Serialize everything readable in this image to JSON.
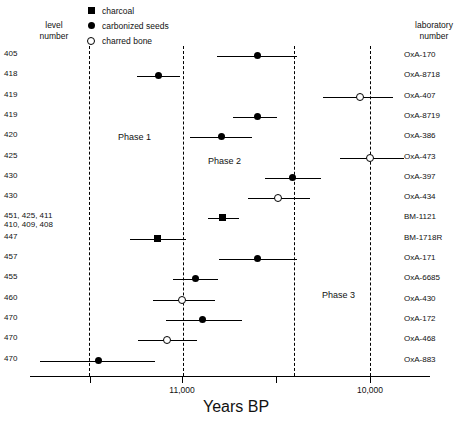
{
  "legend": {
    "items": [
      {
        "symbol": "filled-square",
        "label": "charcoal"
      },
      {
        "symbol": "filled-circle",
        "label": "carbonized seeds"
      },
      {
        "symbol": "open-circle",
        "label": "charred bone"
      }
    ]
  },
  "headers": {
    "level": "level\nnumber",
    "level_line1": "level",
    "level_line2": "number",
    "lab_line1": "laboratory",
    "lab_line2": "number"
  },
  "axis": {
    "title": "Years BP",
    "ticks": [
      {
        "label": "",
        "x": 90
      },
      {
        "label": "11,000",
        "x": 182
      },
      {
        "label": "",
        "x": 276
      },
      {
        "label": "10,000",
        "x": 370
      }
    ],
    "pixel_per_500_years": 93
  },
  "phases": [
    {
      "label": "Phase 1",
      "label_x": 118,
      "label_y": 132,
      "line_x": 89
    },
    {
      "label": "Phase 2",
      "label_x": 208,
      "label_y": 156,
      "line_x": 183
    },
    {
      "label": "Phase 3",
      "label_x": 322,
      "label_y": 290,
      "line_x": 294
    },
    {
      "label": "",
      "label_x": 0,
      "label_y": 0,
      "line_x": 370
    }
  ],
  "chart_data": {
    "type": "scatter",
    "title": "",
    "xlabel": "Years BP",
    "ylabel": "level number",
    "xlim": [
      11250,
      10000
    ],
    "x_axis_reversed": true,
    "grid": false,
    "legend_position": "top-center",
    "series": [
      {
        "name": "charcoal",
        "marker": "filled-square"
      },
      {
        "name": "carbonized seeds",
        "marker": "filled-circle"
      },
      {
        "name": "charred bone",
        "marker": "open-circle"
      }
    ],
    "annotations": [
      "Phase 1",
      "Phase 2",
      "Phase 3"
    ],
    "points": [
      {
        "level": "405",
        "lab": "OxA-170",
        "marker": "filled-circle",
        "value": 10900,
        "low": 11115,
        "high": 10685,
        "px_center": 257,
        "px_left": 217,
        "px_right": 297
      },
      {
        "level": "418",
        "lab": "OxA-8718",
        "marker": "filled-circle",
        "value": 11030,
        "low": 11145,
        "high": 10915,
        "px_center": 158,
        "px_left": 137,
        "px_right": 180
      },
      {
        "level": "419",
        "lab": "OxA-407",
        "marker": "open-circle",
        "value": 10345,
        "low": 10545,
        "high": 10165,
        "px_center": 360,
        "px_left": 323,
        "px_right": 393
      },
      {
        "level": "419",
        "lab": "OxA-8719",
        "marker": "filled-circle",
        "value": 10900,
        "low": 11030,
        "high": 10785,
        "px_center": 257,
        "px_left": 233,
        "px_right": 277
      },
      {
        "level": "420",
        "lab": "OxA-386",
        "marker": "filled-circle",
        "value": 11095,
        "low": 11260,
        "high": 10930,
        "px_center": 221,
        "px_left": 190,
        "px_right": 252
      },
      {
        "level": "425",
        "lab": "OxA-473",
        "marker": "open-circle",
        "value": 10290,
        "low": 10455,
        "high": 10110,
        "px_center": 370,
        "px_left": 340,
        "px_right": 404
      },
      {
        "level": "430",
        "lab": "OxA-397",
        "marker": "filled-circle",
        "value": 10710,
        "low": 10855,
        "high": 10560,
        "px_center": 292,
        "px_left": 265,
        "px_right": 321
      },
      {
        "level": "430",
        "lab": "OxA-434",
        "marker": "open-circle",
        "value": 10785,
        "low": 10945,
        "high": 10625,
        "px_center": 278,
        "px_left": 248,
        "px_right": 310
      },
      {
        "level": "451, 425, 411\n410, 409, 408",
        "lab": "BM-1121",
        "marker": "filled-square",
        "value": 11085,
        "low": 11160,
        "high": 11000,
        "px_center": 222,
        "px_left": 208,
        "px_right": 239
      },
      {
        "level": "447",
        "lab": "BM-1718R",
        "marker": "filled-square",
        "value": 11435,
        "low": 11580,
        "high": 11280,
        "px_center": 157,
        "px_left": 130,
        "px_right": 186
      },
      {
        "level": "457",
        "lab": "OxA-171",
        "marker": "filled-circle",
        "value": 10900,
        "low": 11105,
        "high": 10685,
        "px_center": 257,
        "px_left": 219,
        "px_right": 297
      },
      {
        "level": "455",
        "lab": "OxA-6685",
        "marker": "filled-circle",
        "value": 11230,
        "low": 11350,
        "high": 11110,
        "px_center": 195,
        "px_left": 173,
        "px_right": 218
      },
      {
        "level": "460",
        "lab": "OxA-430",
        "marker": "open-circle",
        "value": 11300,
        "low": 11460,
        "high": 11135,
        "px_center": 182,
        "px_left": 153,
        "px_right": 215
      },
      {
        "level": "470",
        "lab": "OxA-172",
        "marker": "filled-circle",
        "value": 11195,
        "low": 11390,
        "high": 10985,
        "px_center": 202,
        "px_left": 166,
        "px_right": 242
      },
      {
        "level": "470",
        "lab": "OxA-468",
        "marker": "open-circle",
        "value": 11385,
        "low": 11540,
        "high": 11225,
        "px_center": 167,
        "px_left": 138,
        "px_right": 197
      },
      {
        "level": "470",
        "lab": "OxA-883",
        "marker": "filled-circle",
        "value": 11755,
        "low": 12065,
        "high": 11450,
        "px_center": 98,
        "px_left": 40,
        "px_right": 155
      }
    ]
  }
}
